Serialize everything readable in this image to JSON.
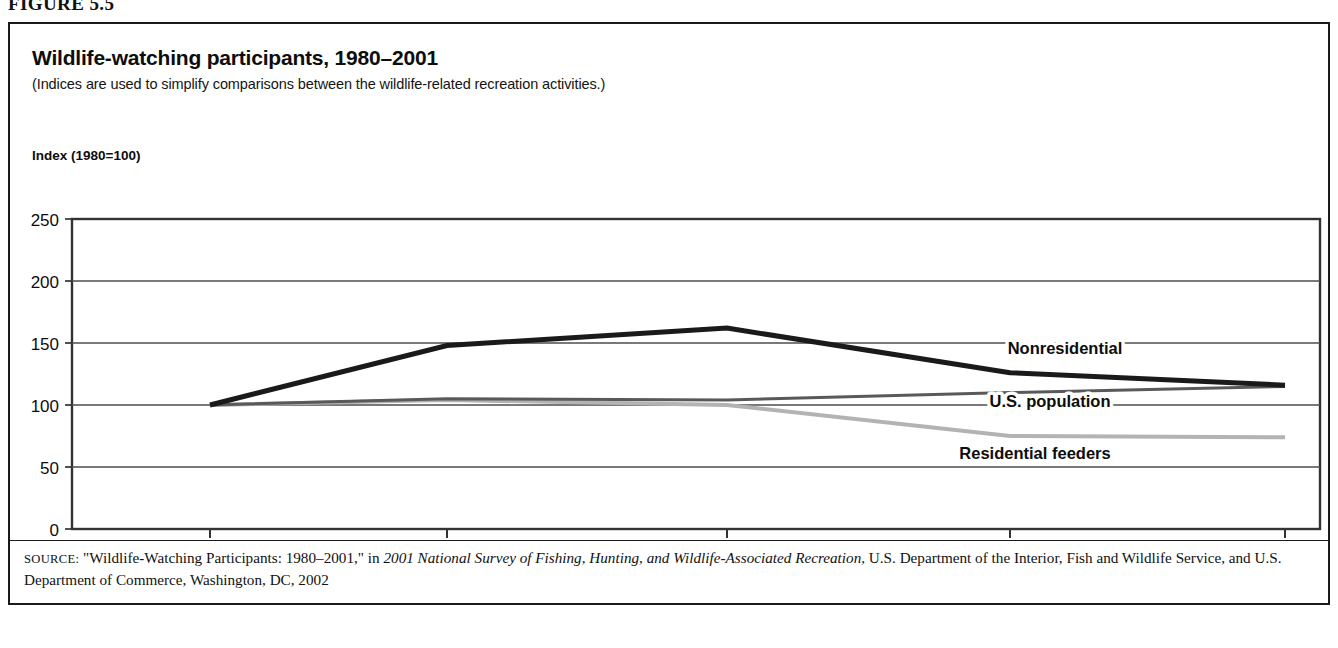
{
  "figure": {
    "label": "FIGURE 5.5"
  },
  "header": {
    "title": "Wildlife-watching participants, 1980–2001",
    "subtitle": "(Indices are used to simplify comparisons between the wildlife-related recreation activities.)"
  },
  "axis": {
    "y_title": "Index (1980=100)"
  },
  "source": {
    "prefix": "SOURCE:",
    "part1": " \"Wildlife-Watching Participants: 1980–2001,\" in ",
    "italic1": "2001 National Survey of Fishing, Hunting, and Wildlife-Associated Recreation,",
    "part2": " U.S. Department of the Interior, Fish and Wildlife Service, and U.S. Department of Commerce, Washington, DC, 2002"
  },
  "colors": {
    "nonresidential": "#1a1a1a",
    "us_population": "#595959",
    "residential_feeders": "#b3b3b3",
    "frame": "#333333",
    "gridline": "#4d4d4d"
  },
  "chart_data": {
    "type": "line",
    "title": "Wildlife-watching participants, 1980–2001",
    "xlabel": "",
    "ylabel": "Index (1980=100)",
    "categories": [
      "1980",
      "1985",
      "1990/1991",
      "1996",
      "2001"
    ],
    "x_tick_labels": [
      "1980",
      "1985",
      "1990/1991",
      "1996",
      "2001"
    ],
    "y_tick_labels": [
      "0",
      "50",
      "100",
      "150",
      "200",
      "250"
    ],
    "y_ticks": [
      0,
      50,
      100,
      150,
      200,
      250
    ],
    "ylim": [
      0,
      250
    ],
    "grid": true,
    "legend_position": "inline-right",
    "series": [
      {
        "name": "Nonresidential",
        "color": "#1a1a1a",
        "width": 5,
        "values": [
          100,
          148,
          162,
          126,
          116
        ],
        "label_x": 1055,
        "label_y": 330
      },
      {
        "name": "U.S. population",
        "color": "#595959",
        "width": 3,
        "values": [
          100,
          105,
          104,
          110,
          115
        ],
        "label_x": 1040,
        "label_y": 383
      },
      {
        "name": "Residential feeders",
        "color": "#b3b3b3",
        "width": 4,
        "values": [
          100,
          104,
          100,
          75,
          74
        ],
        "label_x": 1025,
        "label_y": 435
      }
    ]
  },
  "plot_geometry": {
    "left": 62,
    "right": 1310,
    "top": 195,
    "bottom": 505,
    "tick_x": [
      200,
      437,
      717,
      1000,
      1275
    ]
  }
}
